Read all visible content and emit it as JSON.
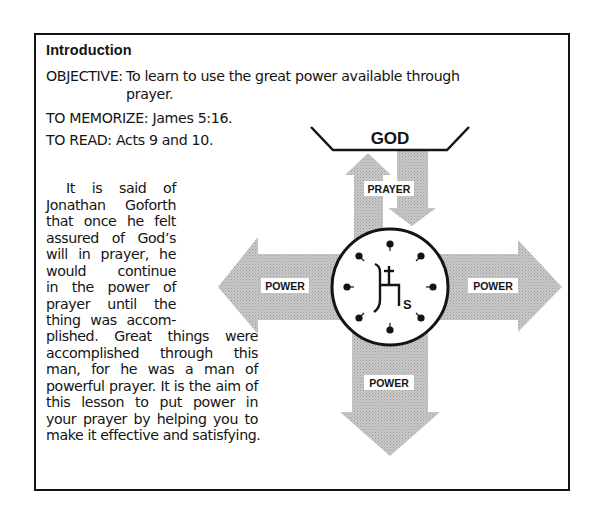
{
  "section": {
    "heading": "Introduction",
    "objective": {
      "label": "OBJECTIVE:",
      "text_line1": "To learn to use the great power available through",
      "text_line2": "prayer."
    },
    "memorize": "TO MEMORIZE: James 5:16.",
    "read": "TO READ: Acts 9 and 10.",
    "paragraph_lines": [
      "It is said of",
      "Jonathan Goforth",
      "that once he felt",
      "assured of God’s",
      "will in prayer, he",
      "would continue",
      "in the power of",
      "prayer until the",
      "thing was accom-",
      "plished. Great things were",
      "accomplished through this",
      "man, for he was a man of",
      "powerful prayer. It is the aim of",
      "this lesson to put power in",
      "your prayer by helping you to",
      "make it effective and satisfying."
    ]
  },
  "diagram": {
    "top_label": "GOD",
    "prayer_label": "PRAYER",
    "left_label": "POWER",
    "right_label": "POWER",
    "bottom_label": "POWER",
    "center_symbol": "clock-face-with-cross-emblem",
    "center_letter": "S",
    "arrow_fill": "#bdbdbd",
    "line_color": "#141414"
  }
}
